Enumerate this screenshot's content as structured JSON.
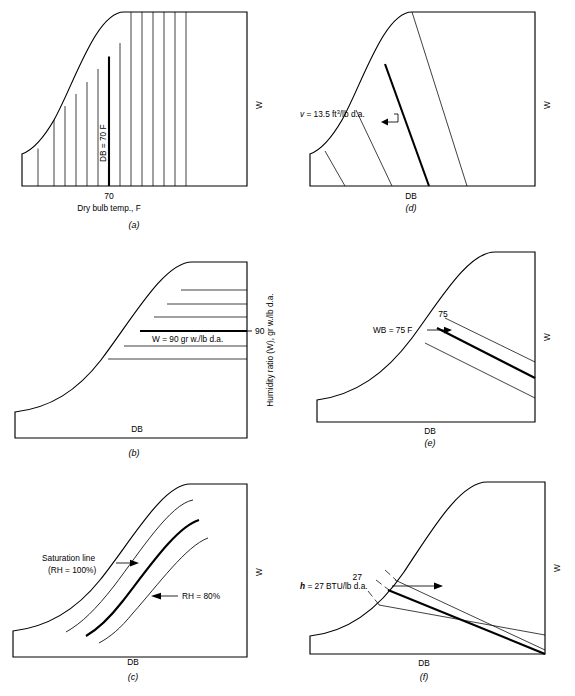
{
  "figure": {
    "panel_count": 6
  },
  "panels": [
    {
      "id": "a",
      "caption": "(a)",
      "property": "dry-bulb-temperature",
      "y_axis_label": "W",
      "x_axis_label": "Dry bulb temp., F",
      "x_tick_label": "70",
      "line_label": "DB = 70 F",
      "line_orientation": "vertical",
      "line_count": 14,
      "highlight_index": 6
    },
    {
      "id": "b",
      "caption": "(b)",
      "property": "humidity-ratio",
      "y_axis_label": "Humidity ratio (W), gr w./lb d.a.",
      "x_axis_label": "DB",
      "y_tick_label": "90",
      "line_label": "W = 90 gr w./lb d.a.",
      "line_orientation": "horizontal",
      "line_count": 6,
      "highlight_index": 3
    },
    {
      "id": "c",
      "caption": "(c)",
      "property": "relative-humidity",
      "y_axis_label": "W",
      "x_axis_label": "DB",
      "label_saturation_line1": "Saturation line",
      "label_saturation_line2": "(RH = 100%)",
      "label_rh": "RH = 80%",
      "line_orientation": "curved",
      "line_count": 4,
      "highlight_index": 2
    },
    {
      "id": "d",
      "caption": "(d)",
      "property": "specific-volume",
      "y_axis_label": "W",
      "x_axis_label": "DB",
      "line_label_prefix": "v",
      "line_label_main": " = 13.5 ft",
      "line_label_sup": "3",
      "line_label_suffix": "/lb d.a.",
      "line_orientation": "steep-negative-slope",
      "line_count": 4,
      "highlight_index": 2
    },
    {
      "id": "e",
      "caption": "(e)",
      "property": "wet-bulb-temperature",
      "y_axis_label": "W",
      "x_axis_label": "DB",
      "line_label": "WB = 75 F",
      "curve_tick_label": "75",
      "line_orientation": "shallow-negative-slope",
      "line_count": 3,
      "highlight_index": 1
    },
    {
      "id": "f",
      "caption": "(f)",
      "property": "enthalpy",
      "y_axis_label": "W",
      "x_axis_label": "DB",
      "line_label_prefix": "h",
      "line_label_main": " = 27 BTU/lb d.a.",
      "scale_tick_label": "27",
      "line_orientation": "shallow-negative-slope",
      "line_count": 3,
      "highlight_index": 1
    }
  ]
}
